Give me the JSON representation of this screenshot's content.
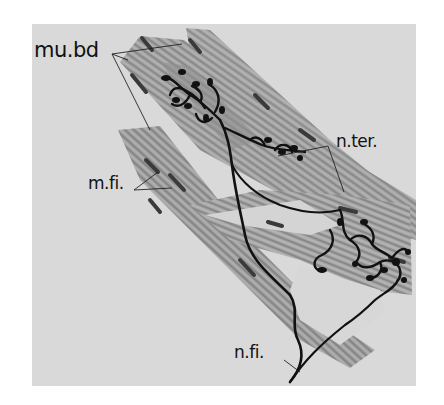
{
  "figure": {
    "type": "histological drawing",
    "colors": {
      "page": "#ffffff",
      "panel": "#d9d9d9",
      "bundle": "#9a9a9a",
      "ink": "#111111"
    }
  },
  "labels": {
    "muscle_bundle": "mu.bd",
    "muscle_fibre": "m.fi.",
    "nerve_terminal": "n.ter.",
    "nerve_fibre": "n.fi."
  }
}
